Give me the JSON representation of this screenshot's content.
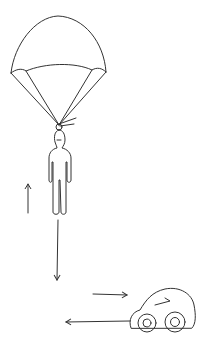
{
  "diagram": {
    "description": "Hand-drawn sketch of a parachutist descending with force arrows (up and down) and a car with motion/force arrows (right and left)",
    "colors": {
      "ink": "#333333",
      "background": "#ffffff"
    },
    "elements": [
      {
        "id": "parachute",
        "label": "parachute canopy"
      },
      {
        "id": "person",
        "label": "stick-figure person"
      },
      {
        "id": "up-arrow",
        "label": "upward force arrow"
      },
      {
        "id": "down-arrow",
        "label": "downward force arrow"
      },
      {
        "id": "right-arrow",
        "label": "rightward arrow"
      },
      {
        "id": "left-arrow",
        "label": "leftward arrow"
      },
      {
        "id": "car",
        "label": "small car"
      }
    ]
  }
}
